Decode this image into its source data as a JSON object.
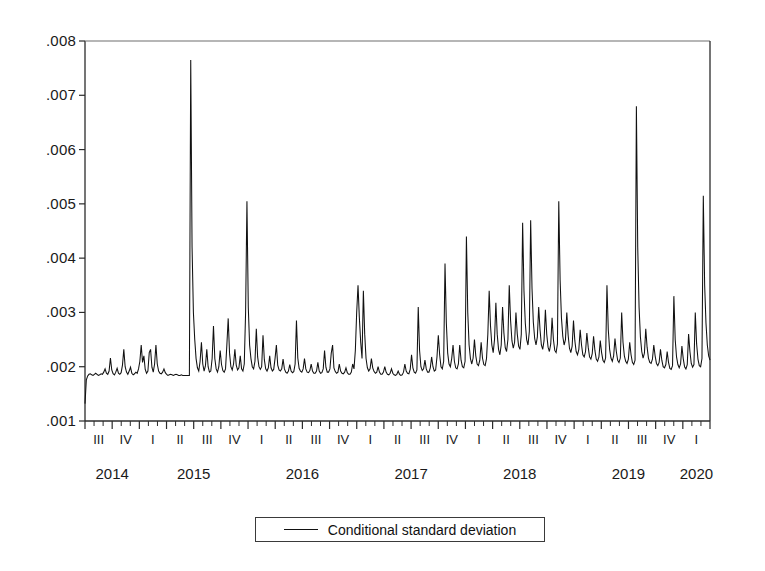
{
  "chart_data": {
    "type": "line",
    "title": "",
    "subtitle": "",
    "xlabel": "",
    "ylabel": "",
    "grid": false,
    "legend_position": "bottom-center",
    "ylim": [
      0.001,
      0.008
    ],
    "ytick_labels": [
      ".008",
      ".007",
      ".006",
      ".005",
      ".004",
      ".003",
      ".002",
      ".001"
    ],
    "ytick_values": [
      0.008,
      0.007,
      0.006,
      0.005,
      0.004,
      0.003,
      0.002,
      0.001
    ],
    "xtick_labels": [
      "III",
      "IV",
      "I",
      "II",
      "III",
      "IV",
      "I",
      "II",
      "III",
      "IV",
      "I",
      "II",
      "III",
      "IV",
      "I",
      "II",
      "III",
      "IV",
      "I",
      "II",
      "III",
      "IV",
      "I"
    ],
    "xtick_years": [
      "2014",
      "2015",
      "2016",
      "2017",
      "2018",
      "2019",
      "2020"
    ],
    "year_tick_index": [
      0,
      2,
      6,
      10,
      14,
      18,
      22
    ],
    "xlim_start": "2014-Q3",
    "xlim_end": "2020-Q1",
    "series": [
      {
        "name": "Conditional standard deviation",
        "color": "#111111",
        "x_start_quarter_index": 0,
        "points_per_quarter": 13,
        "values": [
          0.00132,
          0.00176,
          0.00183,
          0.00186,
          0.00187,
          0.00185,
          0.00184,
          0.00186,
          0.00188,
          0.00186,
          0.00184,
          0.00185,
          0.00187,
          0.00186,
          0.0019,
          0.00196,
          0.00188,
          0.00186,
          0.00192,
          0.00216,
          0.00194,
          0.00187,
          0.00185,
          0.0019,
          0.00197,
          0.00188,
          0.00186,
          0.00189,
          0.00203,
          0.00232,
          0.002,
          0.0019,
          0.00186,
          0.00192,
          0.00199,
          0.00188,
          0.00185,
          0.00187,
          0.0019,
          0.00188,
          0.00196,
          0.0021,
          0.0024,
          0.00208,
          0.0022,
          0.00195,
          0.00188,
          0.00192,
          0.00226,
          0.00232,
          0.00199,
          0.0019,
          0.00205,
          0.0024,
          0.00205,
          0.00192,
          0.00188,
          0.00187,
          0.0019,
          0.00196,
          0.00189,
          0.00186,
          0.00184,
          0.00185,
          0.00186,
          0.00185,
          0.00184,
          0.00185,
          0.00186,
          0.00185,
          0.00184,
          0.00184,
          0.00185,
          0.00184,
          0.00184,
          0.00184,
          0.00184,
          0.00184,
          0.00184,
          0.00765,
          0.0042,
          0.003,
          0.0025,
          0.00215,
          0.00198,
          0.00192,
          0.0021,
          0.00245,
          0.00205,
          0.00192,
          0.00202,
          0.00232,
          0.002,
          0.0019,
          0.00192,
          0.00215,
          0.00275,
          0.00215,
          0.00196,
          0.0019,
          0.002,
          0.0023,
          0.00204,
          0.00193,
          0.0019,
          0.00196,
          0.0024,
          0.00289,
          0.00225,
          0.002,
          0.00194,
          0.00205,
          0.00232,
          0.00203,
          0.00194,
          0.00198,
          0.0022,
          0.00196,
          0.00192,
          0.00205,
          0.003,
          0.00505,
          0.0031,
          0.0024,
          0.00215,
          0.002,
          0.00196,
          0.0021,
          0.0027,
          0.00218,
          0.002,
          0.00195,
          0.002,
          0.00258,
          0.00213,
          0.00196,
          0.00192,
          0.00198,
          0.0022,
          0.00198,
          0.00192,
          0.00195,
          0.00215,
          0.0024,
          0.00203,
          0.00194,
          0.00192,
          0.00196,
          0.00214,
          0.00196,
          0.0019,
          0.00188,
          0.00192,
          0.00204,
          0.00192,
          0.00189,
          0.00191,
          0.00205,
          0.00285,
          0.00216,
          0.00197,
          0.00192,
          0.0019,
          0.00196,
          0.00215,
          0.00196,
          0.0019,
          0.00189,
          0.00193,
          0.00205,
          0.00192,
          0.00188,
          0.00188,
          0.00192,
          0.00208,
          0.00192,
          0.00188,
          0.00189,
          0.00196,
          0.0023,
          0.00199,
          0.0019,
          0.0019,
          0.00196,
          0.00225,
          0.0024,
          0.00198,
          0.00191,
          0.00188,
          0.0019,
          0.00205,
          0.00192,
          0.00188,
          0.00187,
          0.0019,
          0.00198,
          0.00189,
          0.00186,
          0.00186,
          0.0019,
          0.00205,
          0.00196,
          0.0023,
          0.003,
          0.0035,
          0.0029,
          0.00245,
          0.00215,
          0.0034,
          0.0026,
          0.00215,
          0.00198,
          0.00192,
          0.00196,
          0.00215,
          0.00198,
          0.00191,
          0.00188,
          0.0019,
          0.002,
          0.0019,
          0.00186,
          0.00186,
          0.0019,
          0.002,
          0.0019,
          0.00186,
          0.00185,
          0.00188,
          0.00196,
          0.00188,
          0.00185,
          0.00184,
          0.00186,
          0.00192,
          0.00186,
          0.00184,
          0.00185,
          0.0019,
          0.00205,
          0.00192,
          0.00188,
          0.00187,
          0.00195,
          0.00222,
          0.00198,
          0.0019,
          0.00188,
          0.00194,
          0.0031,
          0.0023,
          0.002,
          0.00193,
          0.00196,
          0.00212,
          0.00196,
          0.0019,
          0.0019,
          0.00198,
          0.00218,
          0.002,
          0.00192,
          0.00194,
          0.00218,
          0.00258,
          0.00222,
          0.002,
          0.00196,
          0.0021,
          0.0039,
          0.0028,
          0.00225,
          0.00205,
          0.002,
          0.00215,
          0.0024,
          0.0021,
          0.00198,
          0.00196,
          0.00205,
          0.0024,
          0.00212,
          0.002,
          0.00198,
          0.0021,
          0.0044,
          0.003,
          0.0024,
          0.00215,
          0.00205,
          0.00216,
          0.0025,
          0.0022,
          0.00205,
          0.00202,
          0.00212,
          0.00245,
          0.00216,
          0.00204,
          0.00202,
          0.00215,
          0.0026,
          0.0034,
          0.00275,
          0.0024,
          0.00226,
          0.0025,
          0.00318,
          0.0026,
          0.00232,
          0.00222,
          0.0024,
          0.0031,
          0.00262,
          0.00235,
          0.00228,
          0.0025,
          0.0035,
          0.00285,
          0.00248,
          0.00234,
          0.00245,
          0.003,
          0.0026,
          0.00238,
          0.00232,
          0.0026,
          0.00465,
          0.0034,
          0.0028,
          0.0025,
          0.0024,
          0.00265,
          0.0047,
          0.00345,
          0.00282,
          0.00252,
          0.0024,
          0.00255,
          0.0031,
          0.00268,
          0.0024,
          0.00232,
          0.00248,
          0.00305,
          0.0026,
          0.00236,
          0.00228,
          0.00242,
          0.0029,
          0.0025,
          0.0023,
          0.00226,
          0.00242,
          0.00505,
          0.0036,
          0.0029,
          0.00256,
          0.0024,
          0.0025,
          0.003,
          0.00258,
          0.00234,
          0.00226,
          0.00238,
          0.00285,
          0.00248,
          0.00228,
          0.00222,
          0.00232,
          0.00268,
          0.0024,
          0.00222,
          0.00218,
          0.00228,
          0.00262,
          0.00236,
          0.00218,
          0.00214,
          0.00224,
          0.00256,
          0.0023,
          0.00214,
          0.0021,
          0.00218,
          0.00248,
          0.00226,
          0.00212,
          0.00208,
          0.00216,
          0.0035,
          0.00268,
          0.00232,
          0.00216,
          0.0021,
          0.0022,
          0.00252,
          0.00228,
          0.00212,
          0.00208,
          0.00216,
          0.003,
          0.00245,
          0.0022,
          0.0021,
          0.00206,
          0.00214,
          0.00245,
          0.00222,
          0.00208,
          0.00204,
          0.00212,
          0.0068,
          0.0042,
          0.0031,
          0.00255,
          0.00228,
          0.00216,
          0.00225,
          0.0027,
          0.00236,
          0.00216,
          0.00208,
          0.00206,
          0.00214,
          0.0024,
          0.0022,
          0.00206,
          0.00202,
          0.00208,
          0.00232,
          0.00212,
          0.002,
          0.00198,
          0.00204,
          0.00228,
          0.00208,
          0.00197,
          0.00195,
          0.00202,
          0.0033,
          0.0025,
          0.00218,
          0.00204,
          0.00198,
          0.00205,
          0.00238,
          0.00215,
          0.002,
          0.00196,
          0.00204,
          0.0026,
          0.00228,
          0.00206,
          0.00199,
          0.00204,
          0.003,
          0.00242,
          0.00214,
          0.00202,
          0.002,
          0.00215,
          0.00515,
          0.0035,
          0.0028,
          0.0024,
          0.0022,
          0.00212
        ]
      }
    ]
  },
  "legend": {
    "entries": [
      {
        "label": "Conditional standard deviation",
        "marker": "line"
      }
    ]
  },
  "axes": {
    "y_axis_name": "y-axis",
    "x_axis_name": "x-axis"
  }
}
